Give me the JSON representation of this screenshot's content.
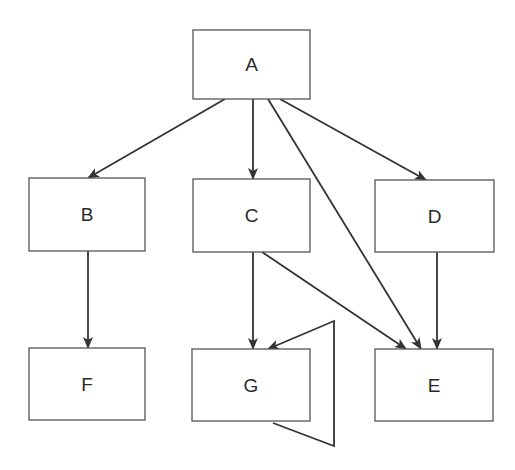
{
  "diagram": {
    "type": "directed-graph",
    "nodes": [
      {
        "id": "A",
        "label": "A",
        "x": 193,
        "y": 30,
        "w": 117,
        "h": 69
      },
      {
        "id": "B",
        "label": "B",
        "x": 29,
        "y": 178,
        "w": 116,
        "h": 73
      },
      {
        "id": "C",
        "label": "C",
        "x": 193,
        "y": 179,
        "w": 117,
        "h": 73
      },
      {
        "id": "D",
        "label": "D",
        "x": 375,
        "y": 180,
        "w": 119,
        "h": 72
      },
      {
        "id": "F",
        "label": "F",
        "x": 29,
        "y": 348,
        "w": 116,
        "h": 72
      },
      {
        "id": "G",
        "label": "G",
        "x": 192,
        "y": 349,
        "w": 118,
        "h": 72
      },
      {
        "id": "E",
        "label": "E",
        "x": 375,
        "y": 349,
        "w": 118,
        "h": 72
      }
    ],
    "edges": [
      {
        "from": "A",
        "to": "B",
        "points": [
          [
            225,
            99
          ],
          [
            88,
            178
          ]
        ]
      },
      {
        "from": "A",
        "to": "C",
        "points": [
          [
            253,
            99
          ],
          [
            253,
            179
          ]
        ]
      },
      {
        "from": "A",
        "to": "E",
        "points": [
          [
            268,
            99
          ],
          [
            421,
            349
          ]
        ]
      },
      {
        "from": "A",
        "to": "D",
        "points": [
          [
            280,
            99
          ],
          [
            426,
            180
          ]
        ]
      },
      {
        "from": "B",
        "to": "F",
        "points": [
          [
            88,
            251
          ],
          [
            88,
            348
          ]
        ]
      },
      {
        "from": "C",
        "to": "G",
        "points": [
          [
            253,
            252
          ],
          [
            253,
            349
          ]
        ]
      },
      {
        "from": "C",
        "to": "E",
        "points": [
          [
            262,
            252
          ],
          [
            406,
            349
          ]
        ]
      },
      {
        "from": "D",
        "to": "E",
        "points": [
          [
            437,
            252
          ],
          [
            437,
            349
          ]
        ]
      },
      {
        "from": "G",
        "to": "G",
        "points": [
          [
            273,
            423
          ],
          [
            334,
            446
          ],
          [
            334,
            321
          ],
          [
            268,
            349
          ]
        ]
      }
    ]
  }
}
